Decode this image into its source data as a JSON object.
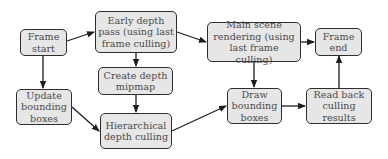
{
  "diagram": {
    "type": "flowchart",
    "nodes": [
      {
        "id": "frame_start",
        "label": "Frame\nstart"
      },
      {
        "id": "early_depth",
        "label": "Early depth\npass (using last\nframe culling)"
      },
      {
        "id": "main_scene",
        "label": "Main scene\nrendering (using\nlast frame culling)"
      },
      {
        "id": "frame_end",
        "label": "Frame\nend"
      },
      {
        "id": "update_bb",
        "label": "Update\nbounding\nboxes"
      },
      {
        "id": "create_mip",
        "label": "Create depth\nmipmap"
      },
      {
        "id": "hier_cull",
        "label": "Hierarchical\ndepth culling"
      },
      {
        "id": "draw_bb",
        "label": "Draw\nbounding\nboxes"
      },
      {
        "id": "read_back",
        "label": "Read back\nculling\nresults"
      }
    ],
    "edges": [
      {
        "from": "frame_start",
        "to": "early_depth"
      },
      {
        "from": "frame_start",
        "to": "update_bb"
      },
      {
        "from": "early_depth",
        "to": "main_scene"
      },
      {
        "from": "early_depth",
        "to": "create_mip"
      },
      {
        "from": "main_scene",
        "to": "frame_end"
      },
      {
        "from": "main_scene",
        "to": "draw_bb"
      },
      {
        "from": "update_bb",
        "to": "hier_cull"
      },
      {
        "from": "create_mip",
        "to": "hier_cull"
      },
      {
        "from": "hier_cull",
        "to": "draw_bb"
      },
      {
        "from": "draw_bb",
        "to": "read_back"
      },
      {
        "from": "read_back",
        "to": "frame_end"
      }
    ]
  },
  "colors": {
    "node_fill": "#e6e6e6",
    "node_border": "#2e2e2e",
    "text": "#4a4a4a",
    "edge": "#1e1e1e"
  }
}
